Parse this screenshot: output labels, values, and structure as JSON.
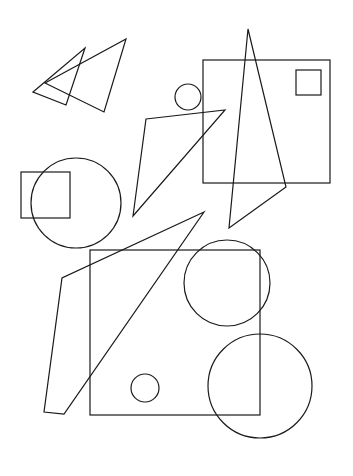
{
  "canvas": {
    "width": 353,
    "height": 476,
    "background_color": "#ffffff",
    "stroke_color": "#1a1a1a",
    "stroke_width": 1.2,
    "fill": "none",
    "title": "Abstract line-art composition of triangles, squares and circles"
  },
  "scene": {
    "shape_count": 15,
    "description": "Black outline geometric shapes on a white background, overlapping without fill"
  },
  "shapes": [
    {
      "id": "triangle-left-arrow",
      "name": "left-pointing-triangle",
      "type": "polygon",
      "points": "33,92 85,48 66,105",
      "stroke": "#1a1a1a"
    },
    {
      "id": "triangle-upper-wide",
      "name": "upper-wide-triangle",
      "type": "polygon",
      "points": "45,83 126,39 104,112",
      "stroke": "#1a1a1a"
    },
    {
      "id": "square-top-right-large",
      "name": "large-top-right-square",
      "type": "rect",
      "x": 203,
      "y": 60,
      "width": 127,
      "height": 123,
      "stroke": "#1a1a1a"
    },
    {
      "id": "square-top-right-small",
      "name": "small-inset-square",
      "type": "rect",
      "x": 296,
      "y": 70,
      "width": 25,
      "height": 25,
      "stroke": "#1a1a1a"
    },
    {
      "id": "triangle-tall-narrow",
      "name": "tall-narrow-triangle",
      "type": "polygon",
      "points": "248,29 286,187 229,228",
      "stroke": "#1a1a1a"
    },
    {
      "id": "circle-small-top",
      "name": "small-top-circle",
      "type": "circle",
      "cx": 188,
      "cy": 97,
      "r": 13,
      "stroke": "#1a1a1a"
    },
    {
      "id": "triangle-thin-center",
      "name": "thin-center-triangle",
      "type": "polygon",
      "points": "146,119 225,110 133,216",
      "stroke": "#1a1a1a"
    },
    {
      "id": "square-mid-left",
      "name": "mid-left-square",
      "type": "rect",
      "x": 21,
      "y": 172,
      "width": 49,
      "height": 46,
      "stroke": "#1a1a1a"
    },
    {
      "id": "circle-mid-left",
      "name": "mid-left-circle",
      "type": "circle",
      "cx": 76,
      "cy": 203,
      "r": 45,
      "stroke": "#1a1a1a"
    },
    {
      "id": "quad-bottom-left",
      "name": "bottom-left-quadrilateral",
      "type": "polygon",
      "points": "204,212 62,278 44,412 64,414",
      "stroke": "#1a1a1a"
    },
    {
      "id": "square-bottom-main",
      "name": "main-bottom-square",
      "type": "rect",
      "x": 90,
      "y": 250,
      "width": 170,
      "height": 165,
      "stroke": "#1a1a1a"
    },
    {
      "id": "circle-bottom-upper-right",
      "name": "upper-right-bottom-circle",
      "type": "circle",
      "cx": 227,
      "cy": 283,
      "r": 43,
      "stroke": "#1a1a1a"
    },
    {
      "id": "circle-bottom-lower-right",
      "name": "lower-right-bottom-circle",
      "type": "circle",
      "cx": 260,
      "cy": 386,
      "r": 52,
      "stroke": "#1a1a1a"
    },
    {
      "id": "circle-small-bottom",
      "name": "small-bottom-circle",
      "type": "circle",
      "cx": 145,
      "cy": 388,
      "r": 14,
      "stroke": "#1a1a1a"
    }
  ]
}
